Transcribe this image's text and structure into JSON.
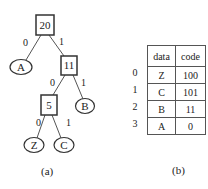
{
  "tree": {
    "nodes": [
      {
        "id": "n20",
        "label": "20",
        "shape": "box",
        "cx": 45,
        "cy": 25
      },
      {
        "id": "nA",
        "label": "A",
        "shape": "ellipse",
        "cx": 21,
        "cy": 67
      },
      {
        "id": "n11",
        "label": "11",
        "shape": "box",
        "cx": 69,
        "cy": 65
      },
      {
        "id": "n5",
        "label": "5",
        "shape": "box",
        "cx": 49,
        "cy": 105
      },
      {
        "id": "nB",
        "label": "B",
        "shape": "ellipse",
        "cx": 85,
        "cy": 106
      },
      {
        "id": "nZ",
        "label": "Z",
        "shape": "ellipse",
        "cx": 34,
        "cy": 145
      },
      {
        "id": "nC",
        "label": "C",
        "shape": "ellipse",
        "cx": 64,
        "cy": 145
      }
    ],
    "edges": [
      {
        "from": "n20",
        "to": "nA",
        "label": "0"
      },
      {
        "from": "n20",
        "to": "n11",
        "label": "1"
      },
      {
        "from": "n11",
        "to": "n5",
        "label": "0"
      },
      {
        "from": "n11",
        "to": "nB",
        "label": "1"
      },
      {
        "from": "n5",
        "to": "nZ",
        "label": "0"
      },
      {
        "from": "n5",
        "to": "nC",
        "label": "1"
      }
    ],
    "caption": "(a)"
  },
  "table": {
    "headers": [
      "data",
      "code"
    ],
    "rows": [
      {
        "index": "0",
        "data": "Z",
        "code": "100"
      },
      {
        "index": "1",
        "data": "C",
        "code": "101"
      },
      {
        "index": "2",
        "data": "B",
        "code": "11"
      },
      {
        "index": "3",
        "data": "A",
        "code": "0"
      }
    ],
    "caption": "(b)"
  }
}
